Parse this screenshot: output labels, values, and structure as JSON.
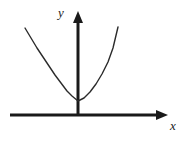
{
  "figure": {
    "background_color": "#ffffff",
    "width": 184,
    "height": 143
  },
  "axes": {
    "stroke_color": "#1a1a1a",
    "stroke_width": 3,
    "origin": {
      "x": 78,
      "y": 115
    },
    "x_axis": {
      "label": "x",
      "label_pos": {
        "x": 170,
        "y": 128
      },
      "start": {
        "x": 10,
        "y": 115
      },
      "end": {
        "x": 168,
        "y": 115
      },
      "arrow": "right-arrow"
    },
    "y_axis": {
      "label": "y",
      "label_pos": {
        "x": 61,
        "y": 17
      },
      "start": {
        "x": 78,
        "y": 115
      },
      "end": {
        "x": 78,
        "y": 11
      },
      "arrow": "up-arrow"
    }
  },
  "chart_data": {
    "type": "line",
    "title": "",
    "xlabel": "x",
    "ylabel": "y",
    "curve_name": "parabola",
    "equation": "y = a*x^2 + c",
    "shape": "upward-opening parabola",
    "vertex_px": {
      "x": 78,
      "y": 101
    },
    "left_endpoint_px": {
      "x": 25,
      "y": 28
    },
    "right_endpoint_px": {
      "x": 118,
      "y": 27
    },
    "stroke_color": "#2b2b2b",
    "stroke_width": 1.4,
    "grid": false,
    "legend": false,
    "tick_labels": [],
    "x": [
      25,
      31,
      37,
      43,
      49,
      55,
      61,
      67,
      72,
      78,
      84,
      90,
      96,
      102,
      108,
      113,
      118
    ],
    "y": [
      28,
      38,
      48,
      57,
      66,
      75,
      83,
      91,
      96,
      101,
      98,
      92,
      84,
      74,
      62,
      48,
      27
    ],
    "path_d": "M 25 28 Q 78 172 118 27"
  },
  "labels": {
    "x_axis_label": "x",
    "y_axis_label": "y"
  }
}
